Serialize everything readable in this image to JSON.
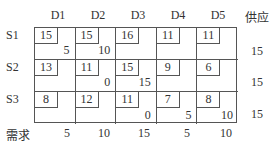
{
  "table": {
    "columns": [
      "D1",
      "D2",
      "D3",
      "D4",
      "D5"
    ],
    "supply_header": "供应",
    "demand_label": "需求",
    "rows": [
      {
        "label": "S1",
        "costs": [
          "15",
          "15",
          "16",
          "11",
          "11"
        ],
        "alloc": [
          "5",
          "10",
          "",
          "",
          ""
        ],
        "supply": "15"
      },
      {
        "label": "S2",
        "costs": [
          "13",
          "11",
          "15",
          "9",
          "6"
        ],
        "alloc": [
          "",
          "0",
          "15",
          "",
          ""
        ],
        "supply": "15"
      },
      {
        "label": "S3",
        "costs": [
          "8",
          "12",
          "11",
          "7",
          "8"
        ],
        "alloc": [
          "",
          "",
          "0",
          "5",
          "10"
        ],
        "supply": "15"
      }
    ],
    "demand": [
      "5",
      "10",
      "15",
      "5",
      "10"
    ]
  }
}
